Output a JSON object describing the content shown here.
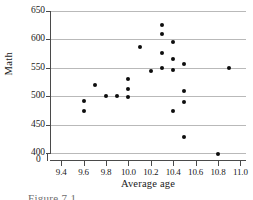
{
  "chart_data": {
    "type": "scatter",
    "title": "",
    "xlabel": "Average age",
    "ylabel": "Math",
    "xlim": [
      9.3,
      11.05
    ],
    "ylim": [
      400,
      650
    ],
    "grid": true,
    "legend": null,
    "xticks": [
      "9.4",
      "9.6",
      "9.8",
      "10.0",
      "10.2",
      "10.4",
      "10.6",
      "10.8",
      "11.0"
    ],
    "xtick_values": [
      9.4,
      9.6,
      9.8,
      10.0,
      10.2,
      10.4,
      10.6,
      10.8,
      11.0
    ],
    "yticks": [
      "400",
      "450",
      "500",
      "550",
      "600",
      "650"
    ],
    "ytick_values": [
      400,
      450,
      500,
      550,
      600,
      650
    ],
    "axis_break_label": "0",
    "marker": "filled-circle",
    "marker_color": "#0d0d0d",
    "points": [
      {
        "x": 9.6,
        "y": 492
      },
      {
        "x": 9.6,
        "y": 474
      },
      {
        "x": 9.7,
        "y": 519
      },
      {
        "x": 9.8,
        "y": 501
      },
      {
        "x": 9.9,
        "y": 501
      },
      {
        "x": 10.0,
        "y": 531
      },
      {
        "x": 10.0,
        "y": 512
      },
      {
        "x": 10.0,
        "y": 498
      },
      {
        "x": 10.1,
        "y": 587
      },
      {
        "x": 10.2,
        "y": 544
      },
      {
        "x": 10.3,
        "y": 625
      },
      {
        "x": 10.3,
        "y": 610
      },
      {
        "x": 10.3,
        "y": 576
      },
      {
        "x": 10.3,
        "y": 549
      },
      {
        "x": 10.4,
        "y": 596
      },
      {
        "x": 10.4,
        "y": 566
      },
      {
        "x": 10.4,
        "y": 547
      },
      {
        "x": 10.4,
        "y": 474
      },
      {
        "x": 10.5,
        "y": 557
      },
      {
        "x": 10.5,
        "y": 510
      },
      {
        "x": 10.5,
        "y": 489
      },
      {
        "x": 10.5,
        "y": 428
      },
      {
        "x": 10.8,
        "y": 399
      },
      {
        "x": 10.9,
        "y": 550
      }
    ]
  },
  "caption": {
    "text": "Figure 7.1"
  },
  "colors": {
    "axis": "#4a4a4a",
    "grid": "#b9b9b9",
    "marker": "#0d0d0d",
    "background": "#ffffff"
  }
}
